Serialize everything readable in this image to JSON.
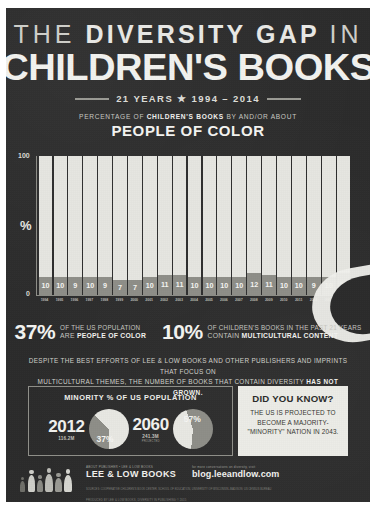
{
  "poster": {
    "title_line1_thin_a": "THE",
    "title_line1_bold": "DIVERSITY GAP",
    "title_line1_thin_b": "IN",
    "title_line2": "CHILDREN'S BOOKS",
    "years_line": "21 YEARS ★ 1994 – 2014",
    "sub_caption_pre": "PERCENTAGE OF ",
    "sub_caption_bold": "CHILDREN'S BOOKS",
    "sub_caption_post": " BY AND/OR ABOUT",
    "sub_headline": "PEOPLE OF COLOR"
  },
  "chart_data": {
    "type": "bar",
    "title": "PEOPLE OF COLOR",
    "xlabel": "",
    "ylabel": "%",
    "ylim": [
      0,
      100
    ],
    "grid": false,
    "legend": "none",
    "y_ticks": [
      "0",
      "100"
    ],
    "categories": [
      "1994",
      "1995",
      "1996",
      "1997",
      "1998",
      "1999",
      "2000",
      "2001",
      "2002",
      "2003",
      "2004",
      "2005",
      "2006",
      "2007",
      "2008",
      "2009",
      "2010",
      "2011",
      "2012",
      "2013",
      "2014"
    ],
    "values": [
      10,
      10,
      9,
      10,
      9,
      7,
      7,
      10,
      11,
      11,
      10,
      10,
      10,
      10,
      12,
      11,
      10,
      10,
      9,
      10,
      14
    ],
    "note": "Each bar is full height (100%); the shaded lower segment shows the percentage of children's books by and/or about people of color."
  },
  "stats": [
    {
      "value": "37%",
      "line1": "OF THE US POPULATION",
      "line2_regular": "ARE ",
      "line2_bold": "PEOPLE OF COLOR"
    },
    {
      "value": "10%",
      "line1": "OF CHILDREN'S BOOKS IN THE PAST 21 YEARS",
      "line2_regular": "CONTAIN ",
      "line2_bold": "MULTICULTURAL CONTENT"
    }
  ],
  "paragraph": {
    "line1": "DESPITE THE BEST EFFORTS OF LEE & LOW BOOKS AND OTHER PUBLISHERS AND IMPRINTS THAT FOCUS ON",
    "line2_pre": "MULTICULTURAL THEMES, THE NUMBER OF BOOKS THAT CONTAIN DIVERSITY ",
    "line2_bold": "HAS NOT GROWN."
  },
  "panel_minority": {
    "title": "MINORITY % OF US POPULATION",
    "pies": [
      {
        "year": "2012",
        "population": "116.2M",
        "projection_note": "",
        "percent_label": "37%",
        "percent_value": 37
      },
      {
        "year": "2060",
        "population": "241.3M",
        "projection_note": "PROJECTED",
        "percent_label": "57%",
        "percent_value": 57
      }
    ]
  },
  "panel_didyouknow": {
    "heading": "DID YOU KNOW?",
    "line1": "THE US IS PROJECTED TO",
    "line2": "BECOME A MAJORITY-",
    "line3": "\"MINORITY\" NATION IN 2043."
  },
  "footer": {
    "brand_small": "ABOUT PUBLISHER • LEE & LOW BOOKS",
    "brand_name": "LEE & LOW BOOKS",
    "blog_small": "for more conversations on diversity, visit",
    "blog_name": "blog.leeandlow.com",
    "sources_line": "SOURCES: COOPERATIVE CHILDREN'S BOOK CENTER, SCHOOL OF EDUCATION, UNIVERSITY OF WISCONSIN–MADISON; US CENSUS BUREAU",
    "produced_line": "PRODUCED BY LEE & LOW BOOKS, DIVERSITY IN PUBLISHING © 2015"
  },
  "colors": {
    "paper": "#2b2b2b",
    "light": "#e6e6e1",
    "mid": "#8e8e88",
    "panel_light": "#ececE7"
  }
}
